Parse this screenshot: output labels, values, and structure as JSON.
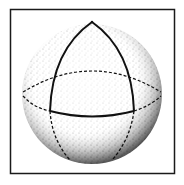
{
  "figure": {
    "frame": {
      "x": 10,
      "y": 9,
      "width": 165,
      "height": 165,
      "stroke": "#1a1a1a"
    },
    "sphere": {
      "cx": 92,
      "cy": 94,
      "r": 70,
      "fill": "#ffffff",
      "stipple_color": "#2a2a2a"
    },
    "pole": {
      "x": 92,
      "y": 22
    },
    "colors": {
      "ink": "#111111",
      "background": "#ffffff"
    }
  }
}
